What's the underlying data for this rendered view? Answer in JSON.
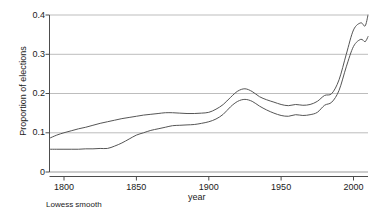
{
  "chart_data": {
    "type": "line",
    "title": "",
    "xlabel": "year",
    "ylabel": "Proportion of elections",
    "annotation": "Lowess smooth",
    "xlim": [
      1790,
      2010
    ],
    "ylim": [
      0,
      0.4
    ],
    "xticks": [
      1800,
      1850,
      1900,
      1950,
      2000
    ],
    "xtick_labels": [
      "1800",
      "1850",
      "1900",
      "1950",
      "2000"
    ],
    "yticks": [
      0,
      0.1,
      0.2,
      0.3,
      0.4
    ],
    "ytick_labels": [
      "0",
      "0.1",
      "0.2",
      "0.3",
      "0.4"
    ],
    "grid": "horizontal",
    "legend_position": "none",
    "line_color": "#555555",
    "grid_color": "#bdbdbd",
    "axis_color": "#4d4d4d",
    "background": "#ffffff",
    "x": [
      1790,
      1795,
      1800,
      1805,
      1810,
      1815,
      1820,
      1825,
      1830,
      1835,
      1840,
      1845,
      1850,
      1855,
      1860,
      1865,
      1870,
      1875,
      1880,
      1885,
      1890,
      1895,
      1900,
      1905,
      1910,
      1915,
      1920,
      1925,
      1930,
      1935,
      1940,
      1945,
      1950,
      1955,
      1960,
      1965,
      1970,
      1975,
      1980,
      1985,
      1990,
      1995,
      2000,
      2005,
      2008,
      2010
    ],
    "series": [
      {
        "name": "upper curve",
        "values": [
          0.086,
          0.094,
          0.1,
          0.105,
          0.11,
          0.114,
          0.119,
          0.124,
          0.128,
          0.132,
          0.136,
          0.139,
          0.142,
          0.145,
          0.147,
          0.149,
          0.151,
          0.151,
          0.15,
          0.149,
          0.149,
          0.15,
          0.152,
          0.16,
          0.172,
          0.19,
          0.206,
          0.212,
          0.205,
          0.192,
          0.184,
          0.178,
          0.172,
          0.169,
          0.172,
          0.17,
          0.172,
          0.18,
          0.195,
          0.2,
          0.235,
          0.3,
          0.362,
          0.38,
          0.372,
          0.4
        ]
      },
      {
        "name": "lower curve",
        "values": [
          0.058,
          0.058,
          0.058,
          0.058,
          0.058,
          0.059,
          0.059,
          0.06,
          0.06,
          0.066,
          0.074,
          0.084,
          0.094,
          0.1,
          0.106,
          0.11,
          0.114,
          0.118,
          0.119,
          0.12,
          0.121,
          0.124,
          0.128,
          0.135,
          0.147,
          0.166,
          0.18,
          0.185,
          0.18,
          0.168,
          0.158,
          0.15,
          0.144,
          0.142,
          0.146,
          0.144,
          0.146,
          0.152,
          0.17,
          0.178,
          0.208,
          0.268,
          0.32,
          0.338,
          0.332,
          0.345
        ]
      }
    ]
  },
  "labels": {
    "ylabel": "Proportion of elections",
    "xlabel": "year",
    "note": "Lowess smooth"
  }
}
